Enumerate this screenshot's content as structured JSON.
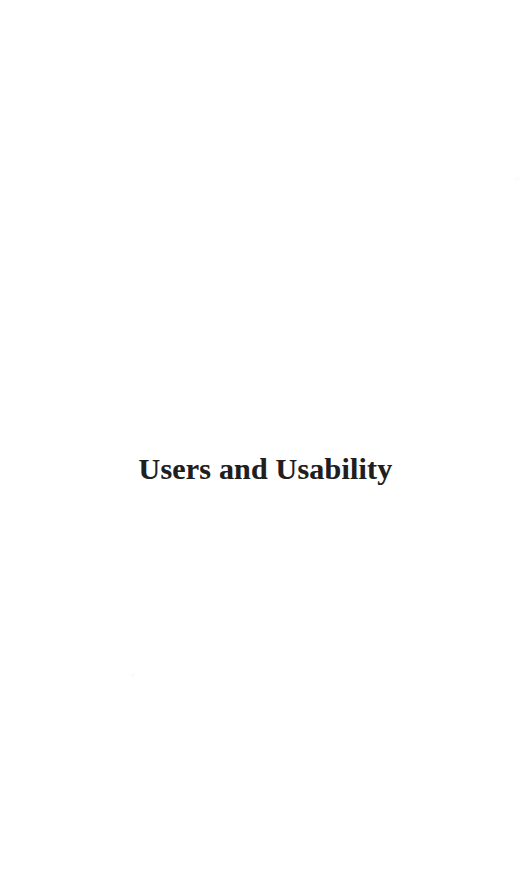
{
  "page": {
    "background_color": "#ffffff",
    "width": 531,
    "height": 881,
    "kind": "part-title-page"
  },
  "title": {
    "text": "Users and Usability",
    "color": "#1f1f1f",
    "weight": "bold",
    "align": "center"
  },
  "artifacts": {
    "speck_left": "",
    "speck_right": ""
  }
}
